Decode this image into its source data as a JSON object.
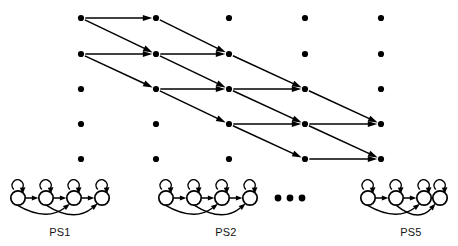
{
  "figure": {
    "width": 458,
    "height": 246,
    "background_color": "#ffffff",
    "ink_color": "#000000"
  },
  "trellis": {
    "columns": 5,
    "rows": 5,
    "column_x": [
      81,
      156,
      229,
      305,
      381
    ],
    "row_y": [
      18,
      54,
      89,
      124,
      159
    ],
    "node_radius": 3.1,
    "node_color": "#000000",
    "nodes": [
      {
        "id": "n-c1-r1",
        "col": 1,
        "row": 1,
        "x": 81,
        "y": 18
      },
      {
        "id": "n-c1-r2",
        "col": 1,
        "row": 2,
        "x": 81,
        "y": 54
      },
      {
        "id": "n-c1-r3",
        "col": 1,
        "row": 3,
        "x": 81,
        "y": 89
      },
      {
        "id": "n-c1-r4",
        "col": 1,
        "row": 4,
        "x": 81,
        "y": 124
      },
      {
        "id": "n-c1-r5",
        "col": 1,
        "row": 5,
        "x": 81,
        "y": 159
      },
      {
        "id": "n-c2-r1",
        "col": 2,
        "row": 1,
        "x": 156,
        "y": 18
      },
      {
        "id": "n-c2-r2",
        "col": 2,
        "row": 2,
        "x": 156,
        "y": 54
      },
      {
        "id": "n-c2-r3",
        "col": 2,
        "row": 3,
        "x": 156,
        "y": 89
      },
      {
        "id": "n-c2-r4",
        "col": 2,
        "row": 4,
        "x": 156,
        "y": 124
      },
      {
        "id": "n-c2-r5",
        "col": 2,
        "row": 5,
        "x": 156,
        "y": 159
      },
      {
        "id": "n-c3-r1",
        "col": 3,
        "row": 1,
        "x": 229,
        "y": 18
      },
      {
        "id": "n-c3-r2",
        "col": 3,
        "row": 2,
        "x": 229,
        "y": 54
      },
      {
        "id": "n-c3-r3",
        "col": 3,
        "row": 3,
        "x": 229,
        "y": 89
      },
      {
        "id": "n-c3-r4",
        "col": 3,
        "row": 4,
        "x": 229,
        "y": 124
      },
      {
        "id": "n-c3-r5",
        "col": 3,
        "row": 5,
        "x": 229,
        "y": 159
      },
      {
        "id": "n-c4-r1",
        "col": 4,
        "row": 1,
        "x": 305,
        "y": 18
      },
      {
        "id": "n-c4-r2",
        "col": 4,
        "row": 2,
        "x": 305,
        "y": 54
      },
      {
        "id": "n-c4-r3",
        "col": 4,
        "row": 3,
        "x": 305,
        "y": 89
      },
      {
        "id": "n-c4-r4",
        "col": 4,
        "row": 4,
        "x": 305,
        "y": 124
      },
      {
        "id": "n-c4-r5",
        "col": 4,
        "row": 5,
        "x": 305,
        "y": 159
      },
      {
        "id": "n-c5-r1",
        "col": 5,
        "row": 1,
        "x": 381,
        "y": 18
      },
      {
        "id": "n-c5-r2",
        "col": 5,
        "row": 2,
        "x": 381,
        "y": 54
      },
      {
        "id": "n-c5-r3",
        "col": 5,
        "row": 3,
        "x": 381,
        "y": 89
      },
      {
        "id": "n-c5-r4",
        "col": 5,
        "row": 4,
        "x": 381,
        "y": 124
      },
      {
        "id": "n-c5-r5",
        "col": 5,
        "row": 5,
        "x": 381,
        "y": 159
      }
    ],
    "edges": [
      {
        "id": "e-c1r1-c2r1",
        "kind": "horizontal",
        "from": "n-c1-r1",
        "to": "n-c2-r1"
      },
      {
        "id": "e-c1r1-c2r2",
        "kind": "diagonal",
        "from": "n-c1-r1",
        "to": "n-c2-r2"
      },
      {
        "id": "e-c1r2-c2r2",
        "kind": "horizontal",
        "from": "n-c1-r2",
        "to": "n-c2-r2"
      },
      {
        "id": "e-c1r2-c2r3",
        "kind": "diagonal",
        "from": "n-c1-r2",
        "to": "n-c2-r3"
      },
      {
        "id": "e-c2r1-c3r2",
        "kind": "diagonal",
        "from": "n-c2-r1",
        "to": "n-c3-r2"
      },
      {
        "id": "e-c2r2-c3r2",
        "kind": "horizontal",
        "from": "n-c2-r2",
        "to": "n-c3-r2"
      },
      {
        "id": "e-c2r2-c3r3",
        "kind": "diagonal",
        "from": "n-c2-r2",
        "to": "n-c3-r3"
      },
      {
        "id": "e-c2r3-c3r3",
        "kind": "horizontal",
        "from": "n-c2-r3",
        "to": "n-c3-r3"
      },
      {
        "id": "e-c2r3-c3r4",
        "kind": "diagonal",
        "from": "n-c2-r3",
        "to": "n-c3-r4"
      },
      {
        "id": "e-c3r2-c4r3",
        "kind": "diagonal",
        "from": "n-c3-r2",
        "to": "n-c4-r3"
      },
      {
        "id": "e-c3r3-c4r3",
        "kind": "horizontal",
        "from": "n-c3-r3",
        "to": "n-c4-r3"
      },
      {
        "id": "e-c3r3-c4r4",
        "kind": "diagonal",
        "from": "n-c3-r3",
        "to": "n-c4-r4"
      },
      {
        "id": "e-c3r4-c4r4",
        "kind": "horizontal",
        "from": "n-c3-r4",
        "to": "n-c4-r4"
      },
      {
        "id": "e-c3r4-c4r5",
        "kind": "diagonal",
        "from": "n-c3-r4",
        "to": "n-c4-r5"
      },
      {
        "id": "e-c4r3-c5r4",
        "kind": "diagonal",
        "from": "n-c4-r3",
        "to": "n-c5-r4"
      },
      {
        "id": "e-c4r4-c5r4",
        "kind": "horizontal",
        "from": "n-c4-r4",
        "to": "n-c5-r4"
      },
      {
        "id": "e-c4r4-c5r5",
        "kind": "diagonal",
        "from": "n-c4-r4",
        "to": "n-c5-r5"
      },
      {
        "id": "e-c4r5-c5r5",
        "kind": "horizontal",
        "from": "n-c4-r5",
        "to": "n-c5-r5"
      }
    ]
  },
  "state_machines": {
    "count_shown": 3,
    "states_per_machine": 4,
    "state_radius": 7.2,
    "baseline_y": 198,
    "label_y": 236,
    "machines": [
      {
        "id": "ps1",
        "label": "PS1",
        "label_x": 60,
        "origin_x": 18,
        "state_cx": [
          18,
          46,
          74,
          102
        ]
      },
      {
        "id": "ps2",
        "label": "PS2",
        "label_x": 226,
        "origin_x": 166,
        "state_cx": [
          166,
          194,
          222,
          250
        ]
      },
      {
        "id": "ps5",
        "label": "PS5",
        "label_x": 411,
        "origin_x": 368,
        "state_cx": [
          368,
          396,
          424,
          440
        ]
      }
    ]
  },
  "ellipsis": {
    "label": "dots",
    "cy": 198,
    "dot_cx": [
      278,
      290,
      302
    ],
    "dot_r": 3.4
  }
}
